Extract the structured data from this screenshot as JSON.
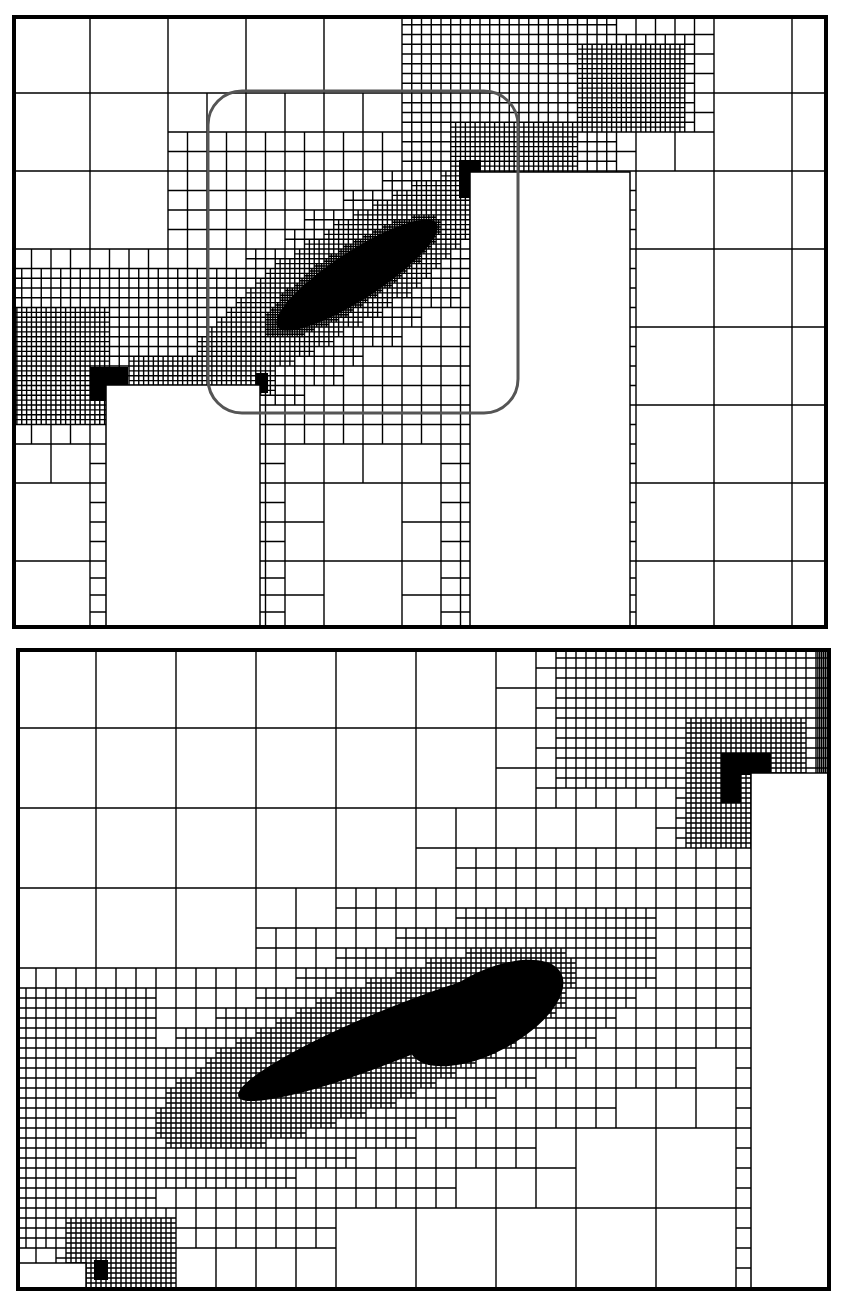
{
  "figure": {
    "colors": {
      "line": "#000000",
      "background": "#ffffff",
      "zoom_box": "#555555",
      "fill_dense": "#000000"
    }
  },
  "panels": [
    {
      "id": "top",
      "width": 816,
      "height": 614,
      "border_width": 4,
      "base_cell": 78,
      "max_level": 5,
      "obstacles": [
        {
          "x": 94,
          "y": 370,
          "w": 154,
          "h": 244
        },
        {
          "x": 458,
          "y": 157,
          "w": 160,
          "h": 457
        }
      ],
      "refinement": [
        {
          "type": "ellipse",
          "cx": 340,
          "cy": 265,
          "rx": 240,
          "ry": 60,
          "angle": -33,
          "level": 3
        },
        {
          "type": "ellipse",
          "cx": 335,
          "cy": 260,
          "rx": 170,
          "ry": 42,
          "angle": -33,
          "level": 4
        },
        {
          "type": "ellipse",
          "cx": 340,
          "cy": 262,
          "rx": 100,
          "ry": 26,
          "angle": -33,
          "level": 5
        },
        {
          "type": "rect",
          "x": 400,
          "y": 0,
          "w": 200,
          "h": 160,
          "level": 3
        },
        {
          "type": "rect",
          "x": 0,
          "y": 260,
          "w": 250,
          "h": 120,
          "level": 3
        },
        {
          "type": "rect",
          "x": 0,
          "y": 300,
          "w": 90,
          "h": 100,
          "level": 4
        },
        {
          "type": "rect",
          "x": 440,
          "y": 110,
          "w": 120,
          "h": 60,
          "level": 4
        },
        {
          "type": "rect",
          "x": 570,
          "y": 35,
          "w": 100,
          "h": 80,
          "level": 4
        },
        {
          "type": "rect",
          "x": 120,
          "y": 350,
          "w": 140,
          "h": 30,
          "level": 4
        },
        {
          "type": "rect",
          "x": 180,
          "y": 130,
          "w": 280,
          "h": 260,
          "level": 2
        }
      ],
      "dense_fills": [
        {
          "type": "ellipse",
          "cx": 345,
          "cy": 260,
          "rx": 95,
          "ry": 24,
          "angle": -33
        },
        {
          "type": "rect",
          "x": 78,
          "y": 352,
          "w": 38,
          "h": 18
        },
        {
          "type": "rect",
          "x": 78,
          "y": 352,
          "w": 16,
          "h": 34
        },
        {
          "type": "rect",
          "x": 447,
          "y": 145,
          "w": 22,
          "h": 12
        },
        {
          "type": "rect",
          "x": 447,
          "y": 145,
          "w": 11,
          "h": 38
        },
        {
          "type": "rect",
          "x": 244,
          "y": 358,
          "w": 12,
          "h": 20
        }
      ],
      "zoom_box": {
        "x": 196,
        "y": 76,
        "w": 310,
        "h": 322,
        "r": 34,
        "stroke_width": 3
      }
    },
    {
      "id": "bottom",
      "width": 815,
      "height": 643,
      "border_width": 4,
      "base_cell": 80,
      "max_level": 4,
      "obstacles": [
        {
          "x": 735,
          "y": 125,
          "w": 80,
          "h": 518
        },
        {
          "x": 0,
          "y": 615,
          "w": 70,
          "h": 28
        }
      ],
      "refinement": [
        {
          "type": "ellipse",
          "cx": 380,
          "cy": 400,
          "rx": 380,
          "ry": 130,
          "angle": -22,
          "level": 2
        },
        {
          "type": "ellipse",
          "cx": 360,
          "cy": 400,
          "rx": 290,
          "ry": 85,
          "angle": -22,
          "level": 3
        },
        {
          "type": "ellipse",
          "cx": 350,
          "cy": 400,
          "rx": 220,
          "ry": 55,
          "angle": -22,
          "level": 4
        },
        {
          "type": "rect",
          "x": 560,
          "y": 0,
          "w": 255,
          "h": 125,
          "level": 3
        },
        {
          "type": "rect",
          "x": 680,
          "y": 80,
          "w": 100,
          "h": 110,
          "level": 4
        },
        {
          "type": "rect",
          "x": 0,
          "y": 360,
          "w": 130,
          "h": 220,
          "level": 3
        },
        {
          "type": "rect",
          "x": 60,
          "y": 580,
          "w": 90,
          "h": 63,
          "level": 4
        }
      ],
      "dense_fills": [
        {
          "type": "ellipse",
          "cx": 380,
          "cy": 385,
          "rx": 170,
          "ry": 26,
          "angle": -22
        },
        {
          "type": "ellipse",
          "cx": 470,
          "cy": 365,
          "rx": 85,
          "ry": 40,
          "angle": -28
        },
        {
          "type": "rect",
          "x": 705,
          "y": 110,
          "w": 20,
          "h": 45
        },
        {
          "type": "rect",
          "x": 705,
          "y": 105,
          "w": 50,
          "h": 22
        },
        {
          "type": "rect",
          "x": 78,
          "y": 612,
          "w": 14,
          "h": 20
        }
      ],
      "zoom_box": null
    }
  ]
}
